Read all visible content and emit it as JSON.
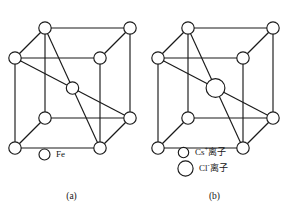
{
  "figure": {
    "stroke_color": "#1a1a1a",
    "fill_color": "#ffffff",
    "background": "#ffffff"
  },
  "panel_a": {
    "caption": "(a)",
    "structure_type": "body-centered cubic",
    "legend": [
      {
        "symbol_radius": 5.5,
        "label": "Fe",
        "label_plain": "Fe"
      }
    ],
    "corner_atom_radius": 6.2,
    "center_atom_radius": 6.2,
    "corner_count": 8,
    "center_count": 1
  },
  "panel_b": {
    "caption": "(b)",
    "structure_type": "cesium chloride cubic",
    "legend": [
      {
        "symbol_radius": 5.2,
        "label_main": "Cs",
        "label_sup": "+",
        "label_tail": "离子",
        "label_plain": "Cs+离子"
      },
      {
        "symbol_radius": 7.6,
        "label_main": "Cl",
        "label_sup": "-",
        "label_tail": "离子",
        "label_plain": "Cl-离子"
      }
    ],
    "corner_atom_radius": 6.2,
    "center_atom_radius": 9.4,
    "corner_count": 8,
    "center_count": 1
  },
  "geometry": {
    "back_top_left": [
      45,
      28
    ],
    "back_top_right": [
      130,
      28
    ],
    "front_top_left": [
      15,
      58
    ],
    "front_top_right": [
      100,
      58
    ],
    "back_bottom_left": [
      45,
      118
    ],
    "back_bottom_right": [
      130,
      118
    ],
    "front_bottom_left": [
      15,
      148
    ],
    "front_bottom_right": [
      100,
      148
    ],
    "center": [
      72.5,
      88
    ]
  }
}
